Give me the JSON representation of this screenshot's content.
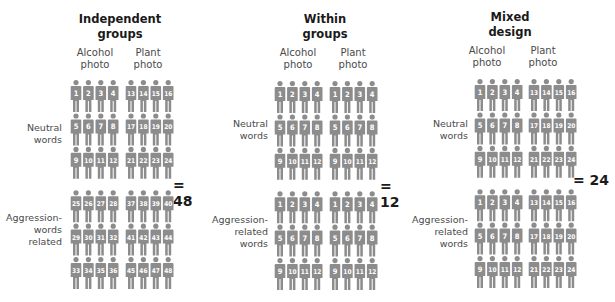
{
  "figure_color": "#8c8c8c",
  "number_color": "#ffffff",
  "panels": [
    {
      "id": "independent",
      "title": "Independent\ngroups",
      "total": "= 48",
      "column_labels": [
        "Alcohol\nphoto",
        "Plant\nphoto"
      ],
      "row_labels": [
        "Neutral\nwords",
        "Aggression-\nwords\nrelated"
      ],
      "numbers": [
        [
          [
            1,
            2,
            3,
            4
          ],
          [
            5,
            6,
            7,
            8
          ],
          [
            9,
            10,
            11,
            12
          ]
        ],
        [
          [
            13,
            14,
            15,
            16
          ],
          [
            17,
            18,
            19,
            20
          ],
          [
            21,
            22,
            23,
            24
          ]
        ],
        [
          [
            25,
            26,
            27,
            28
          ],
          [
            29,
            30,
            31,
            32
          ],
          [
            33,
            34,
            35,
            36
          ]
        ],
        [
          [
            37,
            38,
            39,
            40
          ],
          [
            41,
            42,
            43,
            44
          ],
          [
            45,
            46,
            47,
            48
          ]
        ]
      ]
    },
    {
      "id": "within",
      "title": "Within\ngroups",
      "total": "= 12",
      "column_labels": [
        "Alcohol\nphoto",
        "Plant\nphoto"
      ],
      "row_labels": [
        "Neutral\nwords",
        "Aggression-\nrelated\nwords"
      ],
      "numbers": [
        [
          [
            1,
            2,
            3,
            4
          ],
          [
            5,
            6,
            7,
            8
          ],
          [
            9,
            10,
            11,
            12
          ]
        ],
        [
          [
            1,
            2,
            3,
            4
          ],
          [
            5,
            6,
            7,
            8
          ],
          [
            9,
            10,
            11,
            12
          ]
        ],
        [
          [
            1,
            2,
            3,
            4
          ],
          [
            5,
            6,
            7,
            8
          ],
          [
            9,
            10,
            11,
            12
          ]
        ],
        [
          [
            1,
            2,
            3,
            4
          ],
          [
            5,
            6,
            7,
            8
          ],
          [
            9,
            10,
            11,
            12
          ]
        ]
      ]
    },
    {
      "id": "mixed",
      "title": "Mixed\ndesign",
      "total": "= 24",
      "column_labels": [
        "Alcohol\nphoto",
        "Plant\nphoto"
      ],
      "row_labels": [
        "Neutral\nwords",
        "Aggression-\nrelated\nwords"
      ],
      "numbers": [
        [
          [
            1,
            2,
            3,
            4
          ],
          [
            5,
            6,
            7,
            8
          ],
          [
            9,
            10,
            11,
            12
          ]
        ],
        [
          [
            13,
            14,
            15,
            16
          ],
          [
            17,
            18,
            19,
            20
          ],
          [
            21,
            22,
            23,
            24
          ]
        ],
        [
          [
            1,
            2,
            3,
            4
          ],
          [
            5,
            6,
            7,
            8
          ],
          [
            9,
            10,
            11,
            12
          ]
        ],
        [
          [
            13,
            14,
            15,
            16
          ],
          [
            17,
            18,
            19,
            20
          ],
          [
            21,
            22,
            23,
            24
          ]
        ]
      ]
    }
  ]
}
